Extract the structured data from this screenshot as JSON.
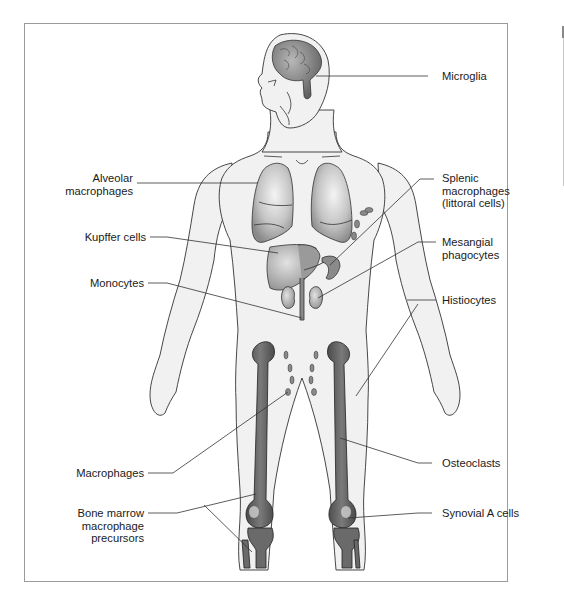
{
  "diagram": {
    "colors": {
      "background": "#ffffff",
      "frame_border": "#9a9a9a",
      "body_fill": "#f1f1f1",
      "body_outline": "#333333",
      "organ_fill": "#bdbdbd",
      "organ_dark": "#6e6e6e",
      "bone_fill": "#5f5f5f",
      "leader_line": "#333333",
      "text": "#1a1a1a"
    },
    "labels": {
      "left": [
        {
          "id": "alveolar",
          "lines": [
            "Alveolar",
            "macrophages"
          ]
        },
        {
          "id": "kupffer",
          "lines": [
            "Kupffer cells"
          ]
        },
        {
          "id": "monocytes",
          "lines": [
            "Monocytes"
          ]
        },
        {
          "id": "macrophages",
          "lines": [
            "Macrophages"
          ]
        },
        {
          "id": "bone-marrow",
          "lines": [
            "Bone marrow",
            "macrophage",
            "precursors"
          ]
        }
      ],
      "right": [
        {
          "id": "microglia",
          "lines": [
            "Microglia"
          ]
        },
        {
          "id": "splenic",
          "lines": [
            "Splenic",
            "macrophages",
            "(littoral cells)"
          ]
        },
        {
          "id": "mesangial",
          "lines": [
            "Mesangial",
            "phagocytes"
          ]
        },
        {
          "id": "histiocytes",
          "lines": [
            "Histiocytes"
          ]
        },
        {
          "id": "osteoclasts",
          "lines": [
            "Osteoclasts"
          ]
        },
        {
          "id": "synovial",
          "lines": [
            "Synovial A cells"
          ]
        }
      ]
    }
  }
}
